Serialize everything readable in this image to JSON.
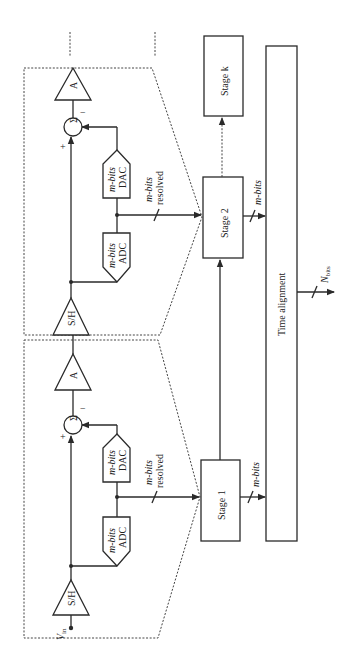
{
  "diagram": {
    "orientation": "rotated 90deg counter-clockwise",
    "input_label": "V",
    "input_subscript": "in",
    "stages": [
      {
        "id": "stage1",
        "label": "Stage 1",
        "sample_hold": "S/H",
        "adc_line1": "m-bits",
        "adc_line2": "ADC",
        "dac_line1": "m-bits",
        "dac_line2": "DAC",
        "summer": "Σ",
        "plus": "+",
        "minus": "−",
        "amp": "A",
        "resolved_line1": "m-bits",
        "resolved_line2": "resolved",
        "output_bits": "m-bits"
      },
      {
        "id": "stage2",
        "label": "Stage 2",
        "sample_hold": "S/H",
        "adc_line1": "m-bits",
        "adc_line2": "ADC",
        "dac_line1": "m-bits",
        "dac_line2": "DAC",
        "summer": "Σ",
        "plus": "+",
        "minus": "−",
        "amp": "A",
        "resolved_line1": "m-bits",
        "resolved_line2": "resolved",
        "output_bits": "m-bits"
      },
      {
        "id": "stagek",
        "label": "Stage k"
      }
    ],
    "time_alignment_label": "Time alignment",
    "output_label": "N",
    "output_subscript": "bits",
    "colors": {
      "line": "#2a2a2a",
      "background": "#ffffff"
    }
  }
}
